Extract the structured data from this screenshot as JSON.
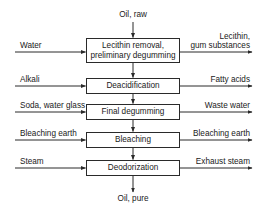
{
  "diagram": {
    "input": {
      "label": "Oil, raw"
    },
    "output": {
      "label": "Oil, pure"
    },
    "steps": [
      {
        "name": "Lecithin removal,\npreliminary degumming",
        "input": "Water",
        "output": "Lecithin,\ngum substances",
        "box": {
          "top": 38,
          "height": 25
        },
        "line_y": 52
      },
      {
        "name": "Deacidification",
        "input": "Alkali",
        "output": "Fatty acids",
        "box": {
          "top": 78,
          "height": 16
        },
        "line_y": 86
      },
      {
        "name": "Final degumming",
        "input": "Soda, water glass",
        "output": "Waste water",
        "box": {
          "top": 104,
          "height": 16
        },
        "line_y": 112
      },
      {
        "name": "Bleaching",
        "input": "Bleaching earth",
        "output": "Bleaching earth",
        "box": {
          "top": 132,
          "height": 16
        },
        "line_y": 140
      },
      {
        "name": "Deodorization",
        "input": "Steam",
        "output": "Exhaust steam",
        "box": {
          "top": 160,
          "height": 16
        },
        "line_y": 168
      }
    ]
  },
  "colors": {
    "line": "#2a2a2a",
    "text": "#1a1a1a",
    "background": "#ffffff"
  }
}
